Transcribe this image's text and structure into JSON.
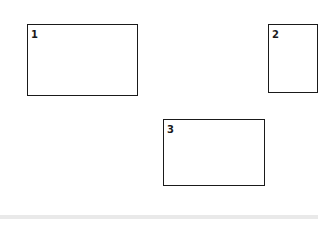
{
  "diagram": {
    "boxes": [
      {
        "label": "1",
        "x": 27,
        "y": 24,
        "width": 111,
        "height": 72
      },
      {
        "label": "2",
        "x": 268,
        "y": 24,
        "width": 50,
        "height": 69
      },
      {
        "label": "3",
        "x": 163,
        "y": 119,
        "width": 102,
        "height": 67
      }
    ],
    "colors": {
      "border": "#1a1a1a",
      "background": "#ffffff",
      "band": "#e9e9e9"
    }
  }
}
